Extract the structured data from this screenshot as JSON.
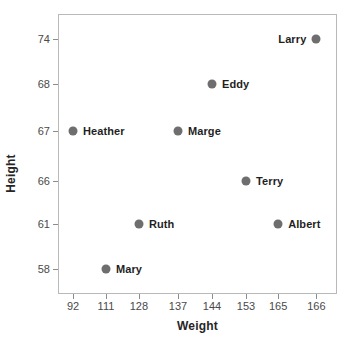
{
  "chart_data": {
    "type": "scatter",
    "title": "",
    "xlabel": "Weight",
    "ylabel": "Height",
    "grid": false,
    "legend": "none",
    "marker_color": "#6e6e6e",
    "frame_color": "#b9b9b9",
    "xticks": [
      "92",
      "111",
      "128",
      "137",
      "144",
      "153",
      "165",
      "166"
    ],
    "yticks": [
      "74",
      "68",
      "67",
      "66",
      "61",
      "58"
    ],
    "xlim": [
      92,
      166
    ],
    "ylim": [
      58,
      74
    ],
    "points": [
      {
        "name": "Larry",
        "x": 166,
        "y": 74,
        "label_side": "left",
        "px": 92.6,
        "py": 8.9
      },
      {
        "name": "Eddy",
        "x": 144,
        "y": 68,
        "label_side": "right",
        "px": 55.2,
        "py": 25.0
      },
      {
        "name": "Heather",
        "x": 92,
        "y": 67,
        "label_side": "right",
        "px": 5.4,
        "py": 41.8
      },
      {
        "name": "Marge",
        "x": 137,
        "y": 67,
        "label_side": "right",
        "px": 43.0,
        "py": 41.8
      },
      {
        "name": "Terry",
        "x": 153,
        "y": 66,
        "label_side": "right",
        "px": 67.4,
        "py": 59.6
      },
      {
        "name": "Ruth",
        "x": 128,
        "y": 61,
        "label_side": "right",
        "px": 29.0,
        "py": 75.0
      },
      {
        "name": "Albert",
        "x": 165,
        "y": 61,
        "label_side": "right",
        "px": 78.9,
        "py": 75.0
      },
      {
        "name": "Mary",
        "x": 111,
        "y": 58,
        "label_side": "right",
        "px": 17.2,
        "py": 91.1
      }
    ],
    "xtick_positions": [
      5.4,
      17.2,
      29.0,
      43.0,
      55.2,
      67.4,
      78.9,
      92.6
    ],
    "ytick_positions": [
      8.9,
      25.0,
      41.8,
      59.6,
      75.0,
      91.1
    ]
  }
}
